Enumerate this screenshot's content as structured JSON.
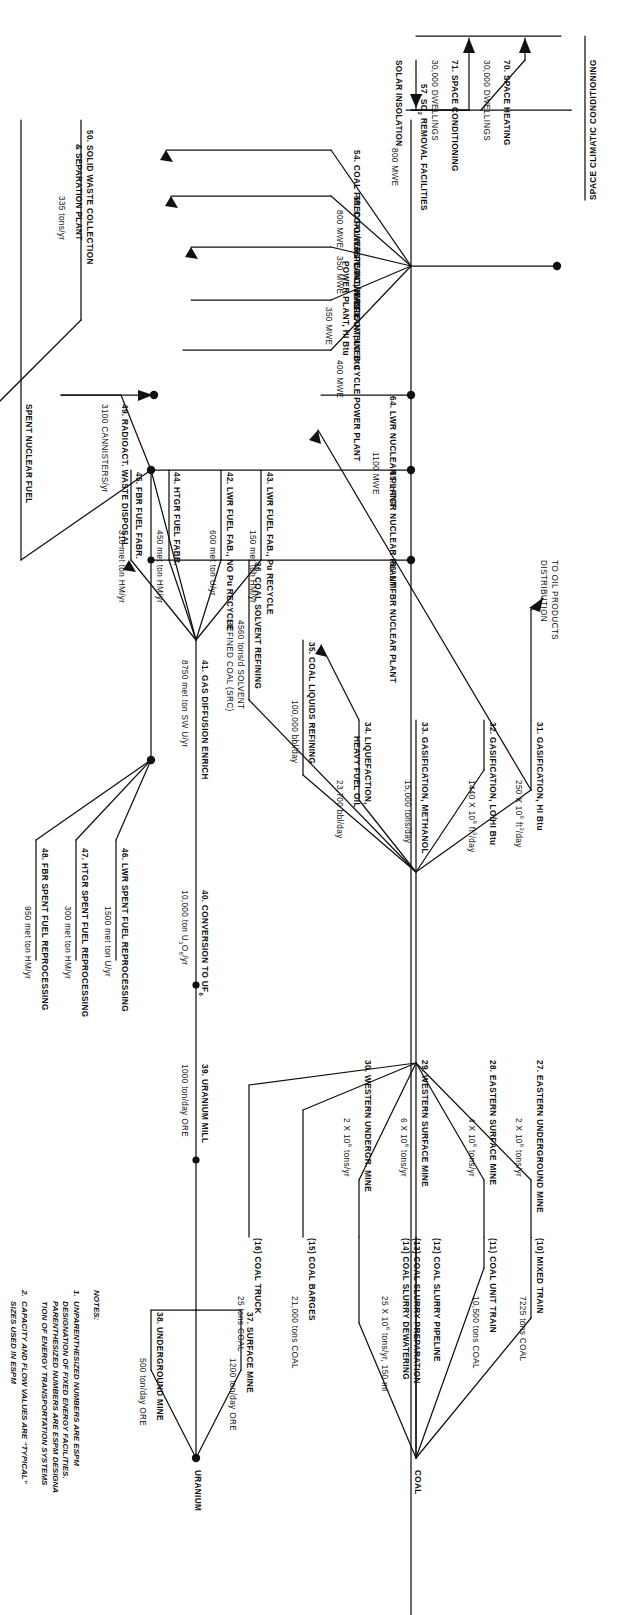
{
  "diagram": {
    "style": {
      "line_color": "#111111",
      "background": "#ffffff"
    },
    "resource_labels": {
      "coal": "COAL",
      "uranium": "URANIUM",
      "solar": "SOLAR INSOLATION",
      "spent_fuel": "SPENT NUCLEAR FUEL",
      "oil_products": "TO OIL PRODUCTS\nDISTRIBUTION",
      "space_climatic": "SPACE CLIMATIC CONDITIONING"
    },
    "facilities": [
      {
        "id": "27",
        "name": "27.  EASTERN UNDERGROUND MINE",
        "value": "2 X 10",
        "exp": "6",
        "unit": " tons/yr"
      },
      {
        "id": "28",
        "name": "28.  EASTERN SURFACE MINE",
        "value": "4 X 10",
        "exp": "6",
        "unit": " tons/yr"
      },
      {
        "id": "29",
        "name": "29.  WESTERN SURFACE MINE",
        "value": "6 X 10",
        "exp": "6",
        "unit": " tons/yr"
      },
      {
        "id": "30",
        "name": "30.  WESTERN UNDERGR. MINE",
        "value": "2 X 10",
        "exp": "6",
        "unit": " tons/yr"
      },
      {
        "id": "10",
        "name": "(10)  MIXED TRAIN",
        "value": "7225 tons COAL",
        "exp": "",
        "unit": ""
      },
      {
        "id": "11",
        "name": "(11)  COAL UNIT TRAIN",
        "value": "10,500 tons COAL",
        "exp": "",
        "unit": ""
      },
      {
        "id": "12",
        "name": "(12)  COAL SLURRY PIPELINE",
        "value": "",
        "exp": "",
        "unit": ""
      },
      {
        "id": "13",
        "name": "(13)  COAL SLURRY PREPARATION",
        "value": "",
        "exp": "",
        "unit": ""
      },
      {
        "id": "14",
        "name": "(14)  COAL SLURRY DEWATERING",
        "value": "25 X 10",
        "exp": "6",
        "unit": " tons/yr, 150 mi"
      },
      {
        "id": "15",
        "name": "(15)  COAL BARGES",
        "value": "21,000 tons COAL",
        "exp": "",
        "unit": ""
      },
      {
        "id": "16",
        "name": "(16)  COAL TRUCK",
        "value": "25 tons COAL",
        "exp": "",
        "unit": ""
      },
      {
        "id": "31",
        "name": "31.  GASIFICATION, HI Btu",
        "value": "250 X 10",
        "exp": "6",
        "unit": " ft³/day"
      },
      {
        "id": "32",
        "name": "32.  GASIFICATION, LO/HI Btu",
        "value": "1440 X 10",
        "exp": "6",
        "unit": " ft³/day"
      },
      {
        "id": "33",
        "name": "33.  GASIFICATION, METHANOL",
        "value": "15,000 tons/day",
        "exp": "",
        "unit": ""
      },
      {
        "id": "34",
        "name": "34.  LIQUEFACTION,\n      HEAVY FUEL OIL",
        "value": "23,700 bbl/day",
        "exp": "",
        "unit": ""
      },
      {
        "id": "35",
        "name": "35.  COAL LIQUIDS REFINING",
        "value": "100,000 bbl/day",
        "exp": "",
        "unit": ""
      },
      {
        "id": "36",
        "name": "36.  COAL SOLVENT REFINING",
        "value": "4560 tons/d SOLVENT\nREFINED COAL (SRC)",
        "exp": "",
        "unit": ""
      },
      {
        "id": "37",
        "name": "37.  SURFACE MINE",
        "value": "1200 ton/day ORE",
        "exp": "",
        "unit": ""
      },
      {
        "id": "38",
        "name": "38.  UNDERGROUND MINE",
        "value": "500 ton/day ORE",
        "exp": "",
        "unit": ""
      },
      {
        "id": "39",
        "name": "39.  URANIUM MILL",
        "value": "1000 ton/day ORE",
        "exp": "",
        "unit": ""
      },
      {
        "id": "40",
        "name": "40.  CONVERSION TO UF",
        "value": "10,000 ton U",
        "exp": "6",
        "unit": "O  /yr"
      },
      {
        "id": "41",
        "name": "41.  GAS DIFFUSION ENRICH",
        "value": "8750 met ton SW U/yr",
        "exp": "",
        "unit": ""
      },
      {
        "id": "42",
        "name": "42.  LWR FUEL FAB., NO Pu RECYCLE",
        "value": "600 met ton U/yr",
        "exp": "",
        "unit": ""
      },
      {
        "id": "43",
        "name": "43.  LWR FUEL FAB., Pu RECYCLE",
        "value": "150 met ton HM/yr",
        "exp": "",
        "unit": ""
      },
      {
        "id": "44",
        "name": "44.  HTGR FUEL FABR.",
        "value": "450 met ton HM/yr",
        "exp": "",
        "unit": ""
      },
      {
        "id": "45",
        "name": "45.  FBR FUEL FABR.",
        "value": "316 met ton HM/yr",
        "exp": "",
        "unit": ""
      },
      {
        "id": "46",
        "name": "46.  LWR SPENT FUEL REPROCESSING",
        "value": "1500 met ton U/yr",
        "exp": "",
        "unit": ""
      },
      {
        "id": "47",
        "name": "47.  HTGR SPENT FUEL REPROCESSING",
        "value": "300 met ton HM/yr",
        "exp": "",
        "unit": ""
      },
      {
        "id": "48",
        "name": "48.  FBR SPENT FUEL REPROCESSING",
        "value": "950 met ton HM/yr",
        "exp": "",
        "unit": ""
      },
      {
        "id": "49",
        "name": "49.  RADIOACT. WASTE DISPOSAL",
        "value": "3100 CANNISTERS/yr",
        "exp": "",
        "unit": ""
      },
      {
        "id": "50",
        "name": "50.  SOLID WASTE COLLECTION\n      & SEPARATION PLANT",
        "value": "335 tons/yr",
        "exp": "",
        "unit": ""
      },
      {
        "id": "54",
        "name": "54.  COAL FIRED POWER PLANT, HI Btu",
        "value": "800 MWE",
        "exp": "",
        "unit": ""
      },
      {
        "id": "55",
        "name": "55.  COAL/WASTE POWER PLANT, LO Btu",
        "value": "350 MWE",
        "exp": "",
        "unit": ""
      },
      {
        "id": "56",
        "name": "56.  COAL/WASTE\n      POWER PLANT, HI Btu",
        "value": "350 MWE",
        "exp": "",
        "unit": ""
      },
      {
        "id": "57",
        "name": "57.  SO   REMOVAL FACILITIES",
        "value": "800 MWE",
        "exp": "2",
        "unit": ""
      },
      {
        "id": "61",
        "name": "61.  COMBINED CYCLE POWER PLANT",
        "value": "400 MWE",
        "exp": "",
        "unit": ""
      },
      {
        "id": "64",
        "name": "64.  LWR NUCLEAR PLANT",
        "value": "1100 MWE",
        "exp": "",
        "unit": ""
      },
      {
        "id": "65",
        "name": "65.  HTGR NUCLEAR PLANT",
        "value": "",
        "exp": "",
        "unit": ""
      },
      {
        "id": "66",
        "name": "66.  LMFBR NUCLEAR PLANT",
        "value": "",
        "exp": "",
        "unit": ""
      },
      {
        "id": "70",
        "name": "70.  SPACE HEATING",
        "value": "30,000 DWELLINGS",
        "exp": "",
        "unit": ""
      },
      {
        "id": "71",
        "name": "71.  SPACE CONDITIONING",
        "value": "30,000 DWELLINGS",
        "exp": "",
        "unit": ""
      }
    ],
    "notes": {
      "heading": "NOTES:",
      "items": [
        "1.  UNPARENTHESIZED NUMBERS ARE ESPM\n     DESIGNATION OF FIXED ENERGY FACILITIES.\n     PARENTHESIZED NUMBERS ARE ESPM DESIGNA\n     TION OF ENERGY TRANSPORTATION SYSTEMS",
        "2.  CAPACITY AND FLOW VALUES ARE “TYPICAL”\n     SIZES USED IN ESPM"
      ]
    }
  }
}
